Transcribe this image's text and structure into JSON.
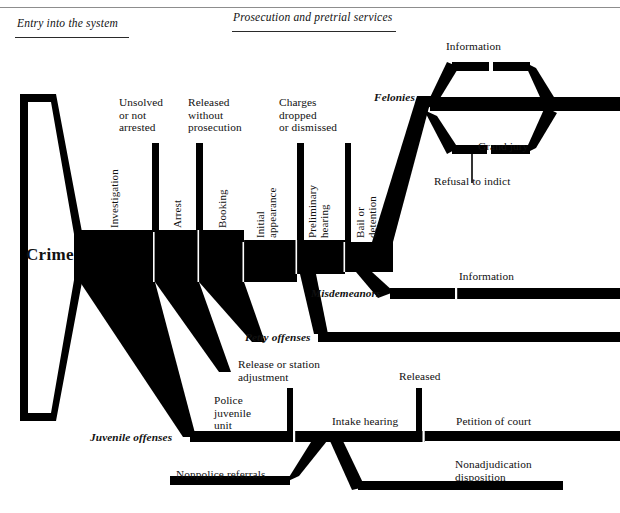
{
  "figure": {
    "top_partial_caption": "",
    "crime_funnel_label": "Crime"
  },
  "sections": [
    {
      "id": "entry",
      "label": "Entry into the system"
    },
    {
      "id": "prosecution",
      "label": "Prosecution and pretrial services"
    }
  ],
  "stages": [
    {
      "id": "investigation",
      "label": "Investigation"
    },
    {
      "id": "arrest",
      "label": "Arrest"
    },
    {
      "id": "booking",
      "label": "Booking"
    },
    {
      "id": "initial-appearance",
      "label": "Initial\nappearance"
    },
    {
      "id": "preliminary-hearing",
      "label": "Preliminary\nhearing"
    },
    {
      "id": "bail-or-detention",
      "label": "Bail or\ndetention"
    }
  ],
  "dropoffs": [
    {
      "id": "unsolved",
      "label": "Unsolved\nor not\narrested"
    },
    {
      "id": "released-without-prosecution",
      "label": "Released\nwithout\nprosecution"
    },
    {
      "id": "charges-dropped",
      "label": "Charges\ndropped\nor dismissed"
    }
  ],
  "tracks": [
    {
      "id": "felonies",
      "label": "Felonies"
    },
    {
      "id": "misdemeanors",
      "label": "Misdemeanors"
    },
    {
      "id": "petty-offenses",
      "label": "Petty offenses"
    },
    {
      "id": "juvenile-offenses",
      "label": "Juvenile offenses"
    }
  ],
  "grand_jury": {
    "information_label": "Information",
    "grand_jury_label": "Grand jury",
    "refusal_label": "Refusal to indict"
  },
  "misdemeanor": {
    "information_label": "Information"
  },
  "juvenile": {
    "release_or_station": "Release or station\nadjustment",
    "police_juvenile_unit": "Police\njuvenile\nunit",
    "nonpolice_referrals": "Nonpolice referrals",
    "released": "Released",
    "intake_hearing": "Intake hearing",
    "petition_of_court": "Petition of court",
    "nonadjudication": "Nonadjudication\ndisposition"
  },
  "colors": {
    "ink": "#000000",
    "rule": "#2a2a2a",
    "top_rule": "#8d8d8d",
    "paper": "#ffffff"
  }
}
